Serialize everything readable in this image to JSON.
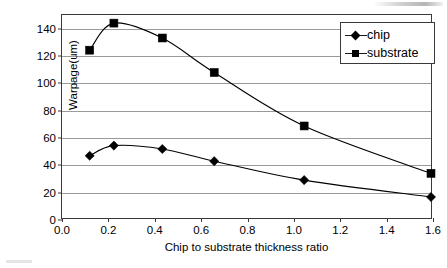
{
  "chart_data": {
    "type": "line",
    "title": "",
    "xlabel": "Chip  to substrate thickness ratio",
    "ylabel": "Warpage(um)",
    "xlim": [
      0.0,
      1.6
    ],
    "ylim": [
      0,
      150
    ],
    "grid": true,
    "legend_position": "top-right",
    "x_ticks": [
      "0.0",
      "0.2",
      "0.4",
      "0.6",
      "0.8",
      "1.0",
      "1.2",
      "1.4",
      "1.6"
    ],
    "x_tick_values": [
      0.0,
      0.2,
      0.4,
      0.6,
      0.8,
      1.0,
      1.2,
      1.4,
      1.6
    ],
    "y_ticks": [
      "0",
      "20",
      "40",
      "60",
      "80",
      "100",
      "120",
      "140"
    ],
    "y_tick_values": [
      0,
      20,
      40,
      60,
      80,
      100,
      120,
      140
    ],
    "x": [
      0.12,
      0.225,
      0.435,
      0.66,
      1.05,
      1.6
    ],
    "series": [
      {
        "name": "chip",
        "marker": "diamond",
        "color": "#000000",
        "values": [
          46,
          53.5,
          51,
          42,
          28,
          15.5
        ]
      },
      {
        "name": "substrate",
        "marker": "square",
        "color": "#000000",
        "values": [
          124,
          144,
          133,
          107.5,
          68,
          33
        ]
      }
    ]
  },
  "legend": {
    "entries": [
      {
        "label": "chip"
      },
      {
        "label": "substrate"
      }
    ]
  }
}
